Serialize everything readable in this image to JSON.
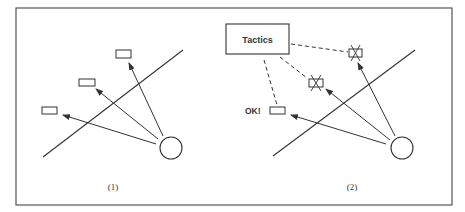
{
  "figure": {
    "panels": [
      {
        "id": "panel-1",
        "caption": "(1)",
        "targets": [
          {
            "label": "",
            "state": "plain"
          },
          {
            "label": "",
            "state": "plain"
          },
          {
            "label": "",
            "state": "plain"
          }
        ]
      },
      {
        "id": "panel-2",
        "caption": "(2)",
        "tactics_box": {
          "label": "Tactics"
        },
        "ok_label": "OK!",
        "targets": [
          {
            "label": "",
            "state": "crossed-out"
          },
          {
            "label": "",
            "state": "crossed-out"
          },
          {
            "label": "OK!",
            "state": "accepted"
          }
        ]
      }
    ]
  },
  "colors": {
    "stroke": "#333333",
    "frame": "#555555",
    "background": "#ffffff"
  }
}
